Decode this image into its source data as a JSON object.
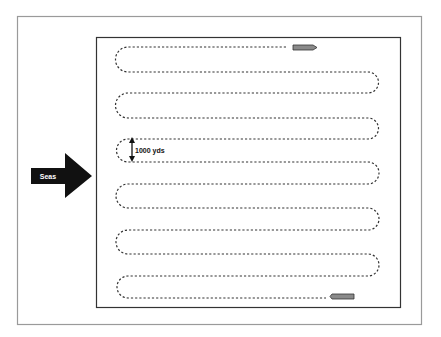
{
  "figure": {
    "outer_frame": {
      "x": 17,
      "y": 16,
      "w": 404,
      "h": 308,
      "stroke": "#9a9a9a"
    },
    "search_area": {
      "x": 96,
      "y": 37,
      "w": 304,
      "h": 270,
      "stroke": "#333333"
    },
    "seas_arrow": {
      "label": "Seas",
      "fill": "#111111",
      "text_color": "#ffffff"
    },
    "spacing_marker": {
      "label": "1000 yds"
    },
    "track": {
      "style": "dashed",
      "color": "#333333",
      "left_x": 128,
      "right_x": 368,
      "lanes_y": [
        47,
        72,
        93,
        118,
        139,
        162,
        184,
        208,
        230,
        254,
        276,
        298
      ],
      "start_end_x": 286,
      "finish_end_x": 326
    },
    "ship_start": {
      "x": 293,
      "y": 45,
      "w": 23,
      "h": 5,
      "fill": "#8a8a8a"
    },
    "ship_finish": {
      "x": 332,
      "y": 294,
      "w": 22,
      "h": 5,
      "fill": "#8a8a8a"
    }
  }
}
